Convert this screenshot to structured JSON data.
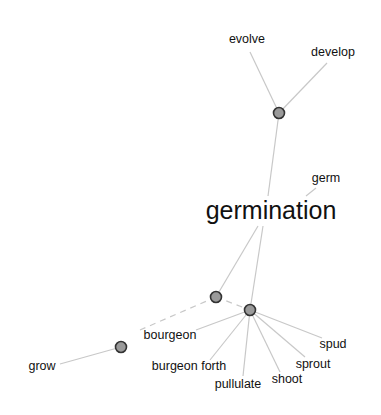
{
  "diagram": {
    "type": "word-association-graph",
    "center_word": "germination",
    "colors": {
      "background": "#ffffff",
      "edge": "#c8c8c8",
      "node_fill": "#9a9a9a",
      "node_stroke": "#333333",
      "text": "#111111"
    },
    "nodes": [
      {
        "id": "n_top",
        "x": 279,
        "y": 113
      },
      {
        "id": "n_mid_left",
        "x": 216,
        "y": 297
      },
      {
        "id": "n_mid",
        "x": 250,
        "y": 310
      },
      {
        "id": "n_low_left",
        "x": 121,
        "y": 347
      }
    ],
    "labels": {
      "germination": {
        "text": "germination",
        "x": 271,
        "y": 219
      },
      "evolve": {
        "text": "evolve",
        "x": 247,
        "y": 43
      },
      "develop": {
        "text": "develop",
        "x": 333,
        "y": 56
      },
      "germ": {
        "text": "germ",
        "x": 326,
        "y": 182
      },
      "bourgeon": {
        "text": "bourgeon",
        "x": 170,
        "y": 339
      },
      "grow": {
        "text": "grow",
        "x": 42,
        "y": 370
      },
      "burgeon_forth": {
        "text": "burgeon forth",
        "x": 189,
        "y": 370
      },
      "pullulate": {
        "text": "pullulate",
        "x": 238,
        "y": 388
      },
      "shoot": {
        "text": "shoot",
        "x": 287,
        "y": 383
      },
      "sprout": {
        "text": "sprout",
        "x": 313,
        "y": 368
      },
      "spud": {
        "text": "spud",
        "x": 333,
        "y": 348
      }
    },
    "edges": [
      {
        "from": "evolve",
        "to": "n_top",
        "x1": 250,
        "y1": 52,
        "x2": 279,
        "y2": 113,
        "style": "solid"
      },
      {
        "from": "develop",
        "to": "n_top",
        "x1": 327,
        "y1": 63,
        "x2": 279,
        "y2": 113,
        "style": "solid"
      },
      {
        "from": "n_top",
        "to": "germination",
        "x1": 279,
        "y1": 113,
        "x2": 268,
        "y2": 196,
        "style": "solid"
      },
      {
        "from": "germ",
        "to": "germination",
        "x1": 316,
        "y1": 188,
        "x2": 306,
        "y2": 196,
        "style": "solid"
      },
      {
        "from": "germination",
        "to": "n_mid_left",
        "x1": 258,
        "y1": 226,
        "x2": 216,
        "y2": 297,
        "style": "solid"
      },
      {
        "from": "germination",
        "to": "n_mid",
        "x1": 263,
        "y1": 226,
        "x2": 250,
        "y2": 310,
        "style": "solid"
      },
      {
        "from": "n_mid_left",
        "to": "n_mid",
        "x1": 216,
        "y1": 297,
        "x2": 250,
        "y2": 310,
        "style": "dashed"
      },
      {
        "from": "n_mid_left",
        "to": "bourgeon",
        "x1": 216,
        "y1": 297,
        "x2": 140,
        "y2": 330,
        "style": "dashed"
      },
      {
        "from": "n_mid",
        "to": "bourgeon",
        "x1": 250,
        "y1": 310,
        "x2": 196,
        "y2": 330,
        "style": "solid"
      },
      {
        "from": "n_mid",
        "to": "burgeon_forth",
        "x1": 250,
        "y1": 310,
        "x2": 210,
        "y2": 360,
        "style": "solid"
      },
      {
        "from": "n_mid",
        "to": "pullulate",
        "x1": 250,
        "y1": 310,
        "x2": 243,
        "y2": 376,
        "style": "solid"
      },
      {
        "from": "n_mid",
        "to": "shoot",
        "x1": 250,
        "y1": 310,
        "x2": 280,
        "y2": 372,
        "style": "solid"
      },
      {
        "from": "n_mid",
        "to": "sprout",
        "x1": 250,
        "y1": 310,
        "x2": 305,
        "y2": 357,
        "style": "solid"
      },
      {
        "from": "n_mid",
        "to": "spud",
        "x1": 250,
        "y1": 310,
        "x2": 322,
        "y2": 338,
        "style": "solid"
      },
      {
        "from": "grow",
        "to": "n_low_left",
        "x1": 60,
        "y1": 364,
        "x2": 121,
        "y2": 347,
        "style": "solid"
      }
    ]
  }
}
